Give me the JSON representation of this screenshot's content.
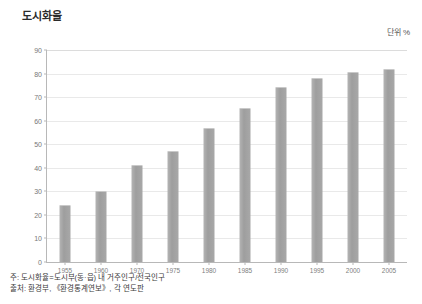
{
  "chart_data": {
    "type": "bar",
    "title": "도시화율",
    "unit_label": "단위 %",
    "xlabel": "",
    "ylabel": "",
    "ylim": [
      0,
      90
    ],
    "ytick_step": 10,
    "yticks": [
      0,
      10,
      20,
      30,
      40,
      50,
      60,
      70,
      80,
      90
    ],
    "grid": true,
    "legend": "none",
    "categories": [
      "1955",
      "1960",
      "1970",
      "1975",
      "1980",
      "1985",
      "1990",
      "1995",
      "2000",
      "2005"
    ],
    "values": [
      24,
      30,
      41,
      47,
      57,
      65.5,
      74.5,
      78,
      80.5,
      82
    ],
    "series": [
      {
        "name": "도시화율",
        "values": [
          24,
          30,
          41,
          47,
          57,
          65.5,
          74.5,
          78,
          80.5,
          82
        ]
      }
    ],
    "bar_color": "#a3a3a3",
    "grid_color": "#e9e9e9",
    "axis_color": "#b8b8b8"
  },
  "footnotes": [
    "주: 도시화율=도시부(동·읍) 내 거주인구/전국인구",
    "출처: 환경부, 《환경통계연보》, 각 연도판"
  ]
}
